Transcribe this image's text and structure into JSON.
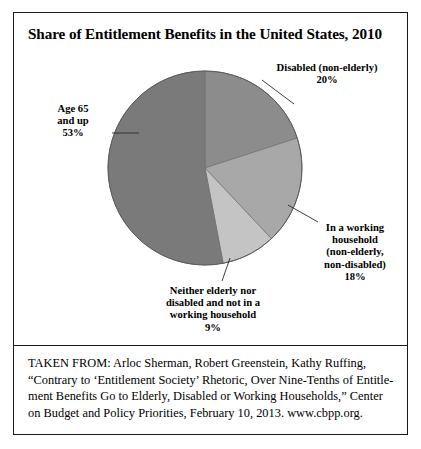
{
  "frame": {
    "divider": true
  },
  "header": {
    "title": "Share of Entitlement Benefits in the United States, 2010"
  },
  "labels": {
    "disabled": {
      "line1": "Disabled (non-elderly)",
      "line2": "20%"
    },
    "age65": {
      "line1": "Age 65",
      "line2": "and up",
      "line3": "53%"
    },
    "working": {
      "line1": "In a working",
      "line2": "household",
      "line3": "(non-elderly,",
      "line4": "non-disabled)",
      "line5": "18%"
    },
    "neither": {
      "line1": "Neither elderly nor",
      "line2": "disabled and not in a",
      "line3": "working household",
      "line4": "9%"
    }
  },
  "citation": {
    "line1": "TAKEN FROM: Arloc Sherman, Robert Greenstein, Kathy Ruffing,",
    "line2": "“Contrary to ‘Entitlement Society’ Rhetoric, Over Nine-Tenths of Entitle-",
    "line3": "ment Benefits Go to Elderly, Disabled or Working Households,” Center",
    "line4": "on Budget and Policy Priorities, February 10, 2013. www.cbpp.org."
  },
  "chart_data": {
    "type": "pie",
    "title": "Share of Entitlement Benefits in the United States, 2010",
    "xlabel": "",
    "ylabel": "",
    "units": "percent",
    "start_angle_deg": 0,
    "direction": "clockwise",
    "legend": "none (direct labels with leader lines)",
    "grid": false,
    "categories": [
      "Disabled (non-elderly)",
      "In a working household (non-elderly, non-disabled)",
      "Neither elderly nor disabled and not in a working household",
      "Age 65 and up"
    ],
    "values": [
      20,
      18,
      9,
      53
    ],
    "slices": [
      {
        "label": "Disabled (non-elderly)",
        "value": 20,
        "color": "#8c8c8c"
      },
      {
        "label": "In a working household (non-elderly, non-disabled)",
        "value": 18,
        "color": "#a8a8a8"
      },
      {
        "label": "Neither elderly nor disabled and not in a working household",
        "value": 9,
        "color": "#c4c4c4"
      },
      {
        "label": "Age 65 and up",
        "value": 53,
        "color": "#7a7a7a"
      }
    ],
    "total": 100,
    "center": {
      "x": 205,
      "y": 168
    },
    "radius": 97
  }
}
